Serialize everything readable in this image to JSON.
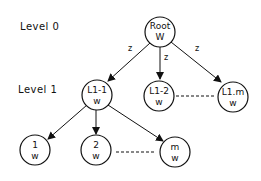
{
  "diagram": {
    "type": "tree",
    "levels": [
      {
        "id": "level-0",
        "label": "Level 0"
      },
      {
        "id": "level-1",
        "label": "Level 1"
      }
    ],
    "nodes": [
      {
        "id": "root",
        "line1": "Root",
        "line2": "W"
      },
      {
        "id": "l1-1",
        "line1": "L1-1",
        "line2": "w"
      },
      {
        "id": "l1-2",
        "line1": "L1-2",
        "line2": "w"
      },
      {
        "id": "l1-m",
        "line1": "L1.m",
        "line2": "w"
      },
      {
        "id": "c1",
        "line1": "1",
        "line2": "w"
      },
      {
        "id": "c2",
        "line1": "2",
        "line2": "w"
      },
      {
        "id": "cm",
        "line1": "m",
        "line2": "w"
      }
    ],
    "edges": [
      {
        "from": "root",
        "to": "l1-1",
        "label": "z"
      },
      {
        "from": "root",
        "to": "l1-2",
        "label": "z"
      },
      {
        "from": "root",
        "to": "l1-m",
        "label": "z"
      },
      {
        "from": "l1-1",
        "to": "c1",
        "label": ""
      },
      {
        "from": "l1-1",
        "to": "c2",
        "label": ""
      },
      {
        "from": "l1-1",
        "to": "cm",
        "label": ""
      }
    ],
    "ellipsis_links": [
      {
        "from": "l1-2",
        "to": "l1-m",
        "style": "dashed"
      },
      {
        "from": "c2",
        "to": "cm",
        "style": "dashed"
      }
    ],
    "colors": {
      "stroke": "#111111",
      "background": "#ffffff"
    }
  }
}
